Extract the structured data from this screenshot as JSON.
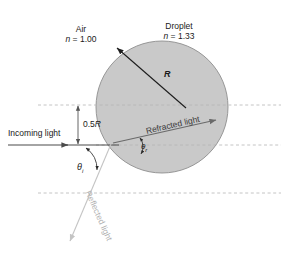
{
  "figure": {
    "width": 287,
    "height": 255,
    "background": "#ffffff"
  },
  "colors": {
    "droplet_fill": "#c9c9c9",
    "droplet_stroke": "#8f8f8f",
    "incoming_ray": "#4a4a4a",
    "refracted_ray": "#6a6a6a",
    "reflected_ray": "#c4c4c4",
    "radius_arrow": "#222222",
    "dashed_guide": "#b5b5b5",
    "dimension_arrow": "#555555",
    "text": "#1a1a1a"
  },
  "labels": {
    "air_name": "Air",
    "air_index": "n = 1.00",
    "air_index_symbol": "n",
    "air_index_value": " = 1.00",
    "droplet_name": "Droplet",
    "droplet_index": "n = 1.33",
    "droplet_index_symbol": "n",
    "droplet_index_value": " = 1.33",
    "radius": "R",
    "half_radius_value": "0.5",
    "half_radius_symbol": "R",
    "half_radius": "0.5R",
    "incoming_light": "Incoming light",
    "refracted_light": "Refracted light",
    "reflected_light": "Reflected light",
    "theta_incidence_symbol": "θ",
    "theta_incidence_sub": "i",
    "theta_refraction_symbol": "θ",
    "theta_refraction_sub": "r"
  },
  "geometry": {
    "droplet_center_x": 162,
    "droplet_center_y": 107,
    "droplet_radius": 66,
    "optical_axis_y": 145,
    "top_guide_y": 105,
    "bottom_guide_y": 193,
    "impact_parameter_label": "0.5R",
    "incoming_ray_start_x": 8,
    "incoming_ray_y": 145
  }
}
